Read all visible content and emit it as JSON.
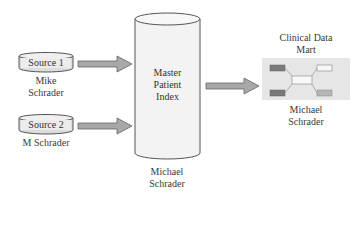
{
  "sources": [
    {
      "label": "Source 1",
      "owner": "Mike Schrader"
    },
    {
      "label": "Source 2",
      "owner": "M Schrader"
    }
  ],
  "mpi": {
    "line1": "Master",
    "line2": "Patient",
    "line3": "Index",
    "owner_line1": "Michael",
    "owner_line2": "Schrader"
  },
  "mart": {
    "title_line1": "Clinical Data",
    "title_line2": "Mart",
    "owner_line1": "Michael",
    "owner_line2": "Schrader"
  },
  "colors": {
    "cylinder_fill": "#f3f3f3",
    "cylinder_stroke": "#555555",
    "arrow_fill": "#a8a8a8",
    "arrow_stroke": "#666666",
    "mart_bg": "#e6e6e6",
    "mart_dark": "#7a7a7a",
    "mart_light": "#b5b5b5"
  }
}
